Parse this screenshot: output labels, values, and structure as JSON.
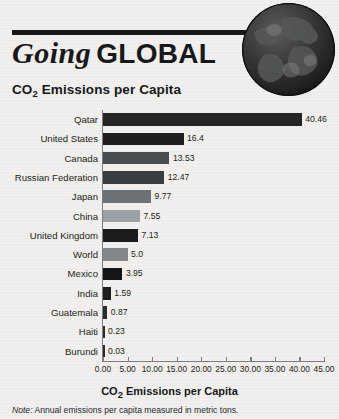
{
  "header": {
    "title_serif": "Going",
    "title_sans": "GLOBAL",
    "globe_icon": "globe-earth-icon"
  },
  "chart_title_prefix": "CO",
  "chart_title_sub": "2",
  "chart_title_suffix": " Emissions per Capita",
  "axis_title_prefix": "CO",
  "axis_title_sub": "2",
  "axis_title_suffix": " Emissions per Capita",
  "note_label": "Note:",
  "note_text": " Annual emissions per capita measured in metric tons.",
  "chart_data": {
    "type": "bar",
    "orientation": "horizontal",
    "title": "CO2 Emissions per Capita",
    "xlabel": "CO2 Emissions per Capita",
    "ylabel": "",
    "xlim": [
      0,
      45
    ],
    "grid": false,
    "legend": "none",
    "tick_labels": [
      "0.00",
      "5.00",
      "10.00",
      "15.00",
      "20.00",
      "25.00",
      "30.00",
      "35.00",
      "40.00",
      "45.00"
    ],
    "tick_values": [
      0,
      5,
      10,
      15,
      20,
      25,
      30,
      35,
      40,
      45
    ],
    "categories": [
      "Qatar",
      "United States",
      "Canada",
      "Russian Federation",
      "Japan",
      "China",
      "United Kingdom",
      "World",
      "Mexico",
      "India",
      "Guatemala",
      "Haiti",
      "Burundi"
    ],
    "values": [
      40.46,
      16.4,
      13.53,
      12.47,
      9.77,
      7.55,
      7.13,
      5.0,
      3.95,
      1.59,
      0.87,
      0.23,
      0.03
    ],
    "value_labels": [
      "40.46",
      "16.4",
      "13.53",
      "12.47",
      "9.77",
      "7.55",
      "7.13",
      "5.0",
      "3.95",
      "1.59",
      "0.87",
      "0.23",
      "0.03"
    ],
    "bar_colors": [
      "#232527",
      "#1d1f21",
      "#4a4d50",
      "#3b3e41",
      "#6e7275",
      "#9ea2a4",
      "#1b1d1f",
      "#85898c",
      "#141618",
      "#1b1d1f",
      "#2b2d2f",
      "#2b2d2f",
      "#2b2d2f"
    ]
  },
  "colors": {
    "background": "#f2f1ef",
    "ink": "#16181a",
    "axis": "#7d7f80"
  }
}
